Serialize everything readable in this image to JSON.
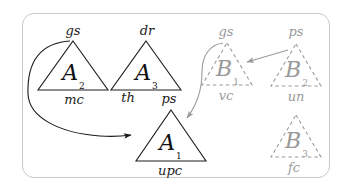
{
  "figure": {
    "type": "diagram",
    "frame": {
      "style": "rounded-rectangle",
      "border_color": "#c9c9c9"
    },
    "colors": {
      "solid_stroke": "#1c1c1c",
      "dashed_stroke": "#9a9a9a",
      "background": "#ffffff"
    }
  },
  "nodes": [
    {
      "id": "A2",
      "style": "solid",
      "glyph": "A",
      "subscript": "2",
      "top_label": "gs",
      "bottom_label": "mc"
    },
    {
      "id": "A3",
      "style": "solid",
      "glyph": "A",
      "subscript": "3",
      "top_label": "dr",
      "bottom_label": "th"
    },
    {
      "id": "A1",
      "style": "solid",
      "glyph": "A",
      "subscript": "1",
      "top_label": "ps",
      "bottom_label": "upc"
    },
    {
      "id": "B1",
      "style": "dashed",
      "glyph": "B",
      "subscript": "1",
      "top_label": "gs",
      "bottom_label": "vc"
    },
    {
      "id": "B2",
      "style": "dashed",
      "glyph": "B",
      "subscript": "2",
      "top_label": "ps",
      "bottom_label": "un"
    },
    {
      "id": "B3",
      "style": "dashed",
      "glyph": "B",
      "subscript": "3",
      "top_label": "",
      "bottom_label": "fc"
    }
  ],
  "edges": [
    {
      "id": "edge-a2-a1",
      "from": "A2",
      "to": "A1",
      "style": "solid-curved",
      "color": "#1c1c1c"
    },
    {
      "id": "edge-b1-a1",
      "from": "B1",
      "to": "A1",
      "style": "dashed-node-curved",
      "color": "#9a9a9a"
    },
    {
      "id": "edge-b2-b1",
      "from": "B2",
      "to": "B1",
      "style": "straight",
      "color": "#9a9a9a"
    }
  ]
}
